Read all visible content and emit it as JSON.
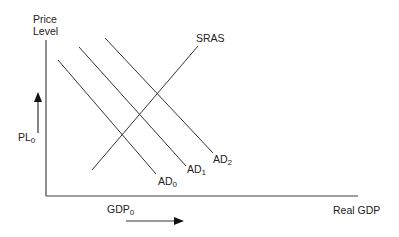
{
  "diagram": {
    "y_axis_label_line1": "Price",
    "y_axis_label_line2": "Level",
    "x_axis_label": "Real GDP",
    "price_marker": {
      "main": "PL",
      "sub": "0"
    },
    "gdp_marker": {
      "main": "GDP",
      "sub": "0"
    },
    "curves": [
      {
        "name": "SRAS",
        "label": "SRAS"
      },
      {
        "name": "AD0",
        "main": "AD",
        "sub": "0"
      },
      {
        "name": "AD1",
        "main": "AD",
        "sub": "1"
      },
      {
        "name": "AD2",
        "main": "AD",
        "sub": "2"
      }
    ],
    "line_color": "#333333"
  }
}
